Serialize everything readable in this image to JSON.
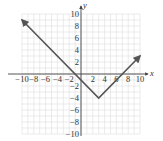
{
  "chart_data": {
    "type": "line",
    "title": "",
    "xlabel": "x",
    "ylabel": "y",
    "xlim": [
      -10,
      10
    ],
    "ylim": [
      -10,
      10
    ],
    "grid": true,
    "grid_step": 1,
    "x_ticks": [
      -10,
      -8,
      -6,
      -4,
      -2,
      2,
      4,
      6,
      8,
      10
    ],
    "y_ticks": [
      10,
      8,
      6,
      4,
      2,
      -2,
      -4,
      -6,
      -8,
      -10
    ],
    "x_tick_labels": [
      "−10",
      "−8",
      "−6",
      "−4",
      "−2",
      "2",
      "4",
      "6",
      "8",
      "10"
    ],
    "y_tick_labels": [
      "10",
      "8",
      "6",
      "4",
      "2",
      "−2",
      "−4",
      "−6",
      "−8",
      "−10"
    ],
    "series": [
      {
        "name": "y = |x − 3| − 4",
        "x": [
          -10,
          3,
          10
        ],
        "y": [
          9,
          -4,
          3
        ],
        "arrows": "both-ends",
        "color": "#555555"
      }
    ],
    "vertex": [
      3,
      -4
    ]
  }
}
